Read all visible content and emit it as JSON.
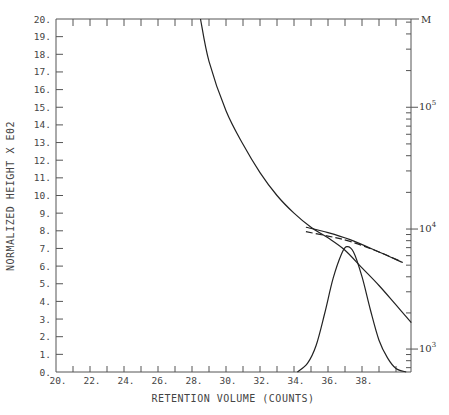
{
  "chart_data": {
    "type": "line",
    "title": "",
    "xlabel": "RETENTION VOLUME (COUNTS)",
    "ylabel": "NORMALIZED HEIGHT X E02",
    "right_axis_label": "M",
    "xlim": [
      20,
      41
    ],
    "ylim": [
      0,
      20
    ],
    "x_tick_labels": [
      "20.",
      "22.",
      "24.",
      "26.",
      "28.",
      "30.",
      "32.",
      "34.",
      "36.",
      "38."
    ],
    "y_tick_labels": [
      "0.",
      "1.",
      "2.",
      "3.",
      "4.",
      "5.",
      "6.",
      "7.",
      "8.",
      "9.",
      "10.",
      "11.",
      "12.",
      "13.",
      "14.",
      "15.",
      "16.",
      "17.",
      "18.",
      "19.",
      "20."
    ],
    "right_axis_ticks": [
      {
        "label": "10",
        "exp": "3",
        "y": 1.3
      },
      {
        "label": "10",
        "exp": "4",
        "y": 8.1
      },
      {
        "label": "10",
        "exp": "5",
        "y": 15.0
      }
    ],
    "grid": false,
    "series": [
      {
        "name": "calibration curve (log M vs retention volume)",
        "style": "solid",
        "points": [
          [
            28.5,
            20
          ],
          [
            29.0,
            17.6
          ],
          [
            30.0,
            14.8
          ],
          [
            31.0,
            12.9
          ],
          [
            32.0,
            11.3
          ],
          [
            33.0,
            10.0
          ],
          [
            34.0,
            9.0
          ],
          [
            35.0,
            8.2
          ],
          [
            36.0,
            7.6
          ],
          [
            37.0,
            6.9
          ],
          [
            38.0,
            5.9
          ],
          [
            39.0,
            4.9
          ],
          [
            40.0,
            3.8
          ],
          [
            40.9,
            2.8
          ]
        ]
      },
      {
        "name": "upper solid line",
        "style": "solid",
        "points": [
          [
            34.7,
            8.2
          ],
          [
            36.0,
            7.9
          ],
          [
            37.3,
            7.5
          ],
          [
            39.0,
            6.8
          ],
          [
            40.4,
            6.2
          ]
        ]
      },
      {
        "name": "dashed line",
        "style": "dashed",
        "points": [
          [
            34.7,
            7.95
          ],
          [
            36.0,
            7.7
          ],
          [
            37.3,
            7.4
          ],
          [
            39.0,
            6.8
          ],
          [
            40.2,
            6.3
          ]
        ]
      },
      {
        "name": "normalized chromatogram (peak)",
        "style": "solid",
        "points": [
          [
            34.2,
            0
          ],
          [
            34.8,
            0.5
          ],
          [
            35.3,
            1.5
          ],
          [
            35.8,
            3.3
          ],
          [
            36.3,
            5.3
          ],
          [
            36.8,
            6.7
          ],
          [
            37.1,
            7.1
          ],
          [
            37.5,
            6.8
          ],
          [
            38.0,
            5.4
          ],
          [
            38.5,
            3.5
          ],
          [
            39.0,
            1.8
          ],
          [
            39.5,
            0.8
          ],
          [
            40.0,
            0.2
          ],
          [
            40.6,
            0
          ]
        ]
      }
    ]
  }
}
